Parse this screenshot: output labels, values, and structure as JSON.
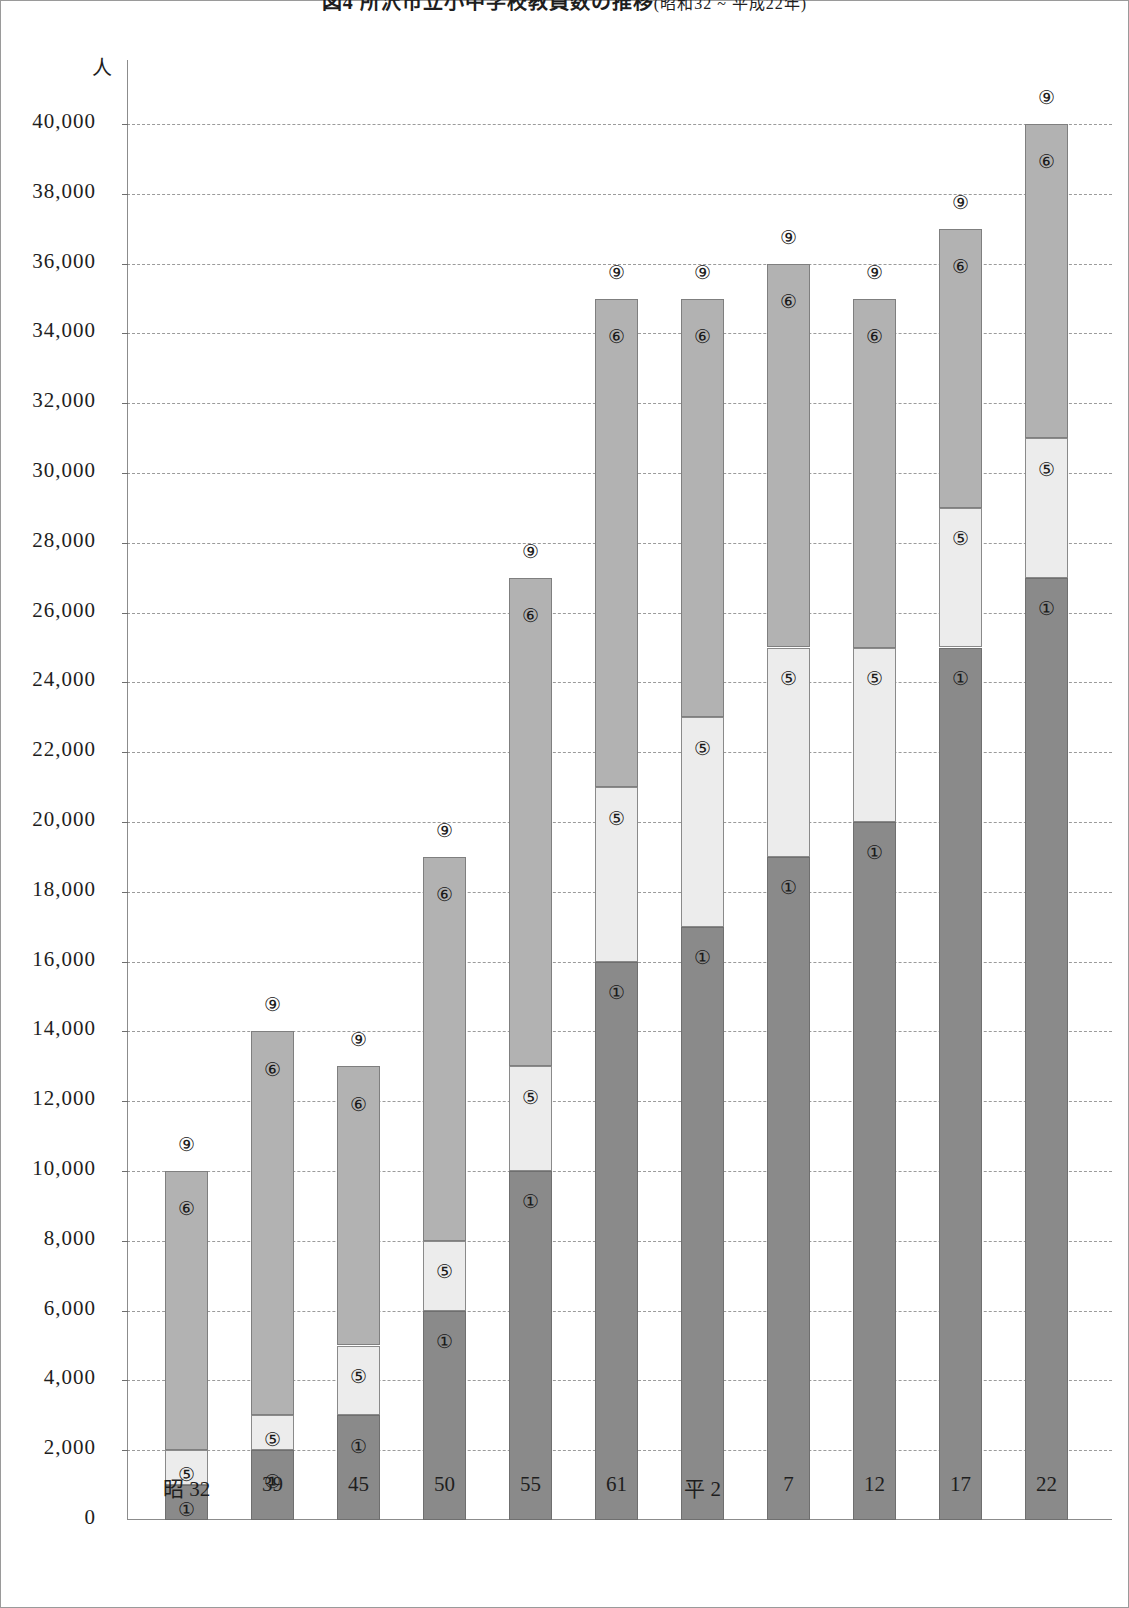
{
  "title": {
    "main": "図4 所沢市立小中学校教員数の推移",
    "range": "(昭和32 ~ 平成22年)"
  },
  "axis": {
    "y_unit": "人",
    "y_ticks": [
      "0",
      "2,000",
      "4,000",
      "6,000",
      "8,000",
      "10,000",
      "12,000",
      "14,000",
      "16,000",
      "18,000",
      "20,000",
      "22,000",
      "24,000",
      "26,000",
      "28,000",
      "30,000",
      "32,000",
      "34,000",
      "36,000",
      "38,000",
      "40,000"
    ],
    "x_labels": [
      "昭 32",
      "39",
      "45",
      "50",
      "55",
      "61",
      "平 2",
      "7",
      "12",
      "17",
      "22"
    ]
  },
  "series_marks": {
    "bottom": "①",
    "middle": "⑤",
    "top": "⑥",
    "total": "⑨"
  },
  "colors": {
    "segment_bottom": "#8a8a8a",
    "segment_middle": "#ececec",
    "segment_top": "#b2b2b2",
    "gridline": "#9b9b9b",
    "axis": "#8c8c8c",
    "text": "#1a1a1a"
  },
  "chart_data": {
    "type": "bar",
    "stacked": true,
    "xlabel": "",
    "ylabel": "人",
    "ylim": [
      0,
      40000
    ],
    "ytick_step": 2000,
    "grid": true,
    "legend": "none",
    "categories": [
      "昭 32",
      "39",
      "45",
      "50",
      "55",
      "61",
      "平 2",
      "7",
      "12",
      "17",
      "22"
    ],
    "series": [
      {
        "name": "①",
        "mark": "①",
        "values": [
          1000,
          2000,
          3000,
          6000,
          10000,
          16000,
          17000,
          19000,
          20000,
          25000,
          27000
        ]
      },
      {
        "name": "⑤",
        "mark": "⑤",
        "values": [
          1000,
          1000,
          2000,
          2000,
          3000,
          5000,
          6000,
          6000,
          5000,
          4000,
          4000
        ]
      },
      {
        "name": "⑥",
        "mark": "⑥",
        "values": [
          8000,
          11000,
          8000,
          11000,
          14000,
          14000,
          12000,
          11000,
          10000,
          8000,
          9000
        ]
      }
    ],
    "cumulative_tops": {
      "①": [
        1000,
        2000,
        3000,
        6000,
        10000,
        16000,
        17000,
        19000,
        20000,
        25000,
        27000
      ],
      "⑤": [
        2000,
        3000,
        5000,
        8000,
        13000,
        21000,
        23000,
        25000,
        25000,
        29000,
        31000
      ],
      "⑨": [
        10000,
        14000,
        13000,
        19000,
        27000,
        35000,
        35000,
        36000,
        35000,
        37000,
        40000
      ]
    },
    "totals": [
      10000,
      14000,
      13000,
      19000,
      27000,
      35000,
      35000,
      36000,
      35000,
      37000,
      40000
    ]
  }
}
